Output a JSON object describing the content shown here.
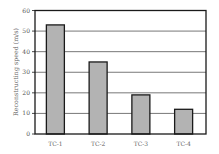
{
  "chart_data": {
    "type": "bar",
    "title": "",
    "xlabel": "",
    "ylabel": "Reconstructing speed (m/s)",
    "categories": [
      "TC-1",
      "TC-2",
      "TC-3",
      "TC-4"
    ],
    "values": [
      53,
      35,
      19,
      12
    ],
    "ylim": [
      0,
      60
    ],
    "yticks": [
      0,
      10,
      20,
      30,
      40,
      50,
      60
    ],
    "grid": "horizontal",
    "legend": "none",
    "colors": {
      "bar_fill": "#b3b3b3",
      "bar_edge": "#1a1a1a",
      "grid": "#555555",
      "frame": "#1a1a1a"
    }
  }
}
